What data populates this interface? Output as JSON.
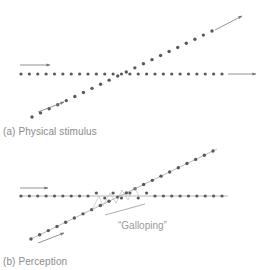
{
  "panels": [
    {
      "id": "a",
      "caption": "(a)  Physical stimulus",
      "description": "Horizontal dot row and rising diagonal dot row cross; both continue straight through the intersection.",
      "horizontal_row": {
        "y": 74,
        "x_start": 21,
        "x_end": 222,
        "count": 25
      },
      "diagonal_row": {
        "x_start": 32,
        "y_start": 117,
        "x_end": 212,
        "y_end": 31,
        "count": 22
      },
      "arrows": [
        {
          "name": "horizontal-motion-arrow-top",
          "x1": 20,
          "y1": 65,
          "x2": 50,
          "y2": 65
        },
        {
          "name": "horizontal-motion-arrow-right",
          "x1": 228,
          "y1": 74,
          "x2": 256,
          "y2": 74
        },
        {
          "name": "diagonal-motion-arrow-bottom",
          "x1": 38,
          "y1": 112,
          "x2": 64,
          "y2": 102
        },
        {
          "name": "diagonal-motion-arrow-top",
          "x1": 215,
          "y1": 30,
          "x2": 242,
          "y2": 16
        }
      ]
    },
    {
      "id": "b",
      "caption": "(b)  Perception",
      "description": "Dots near the crossing appear to jump between paths, producing a 'galloping' percept.",
      "horizontal_row": {
        "y": 196,
        "x_start": 21,
        "x_end": 222,
        "count": 25
      },
      "diagonal_row": {
        "x_start": 31,
        "y_start": 239,
        "x_end": 213,
        "y_end": 151,
        "count": 22
      },
      "arrows": [
        {
          "name": "horizontal-motion-arrow-top",
          "x1": 20,
          "y1": 188,
          "x2": 48,
          "y2": 188
        },
        {
          "name": "diagonal-motion-arrow-bottom",
          "x1": 38,
          "y1": 243,
          "x2": 64,
          "y2": 233
        }
      ],
      "annotation": {
        "label": "“Galloping”",
        "pointer": {
          "x1": 105,
          "y1": 215,
          "x2": 145,
          "y2": 204
        }
      }
    }
  ],
  "colors": {
    "dot": "#5a5a5a",
    "arrow": "#777777",
    "text": "#8a8a8a",
    "background": "#ffffff"
  }
}
